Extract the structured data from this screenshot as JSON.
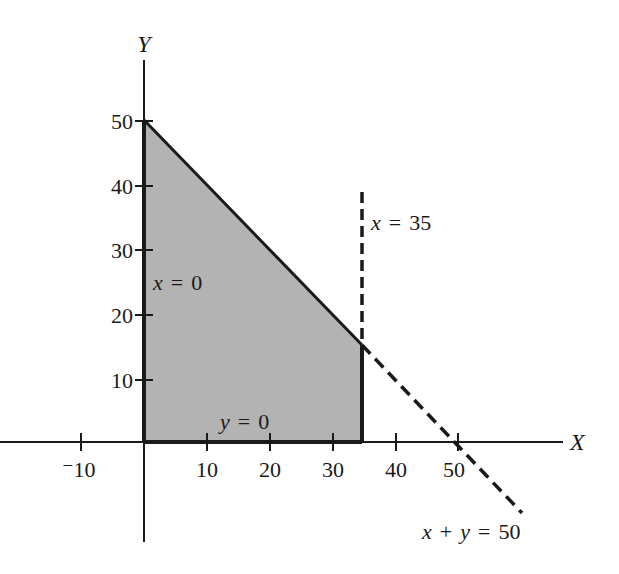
{
  "figure": {
    "axes": {
      "x_label": "X",
      "y_label": "Y",
      "x_ticks": [
        {
          "value": -10,
          "label": "⁻10"
        },
        {
          "value": 10,
          "label": "10"
        },
        {
          "value": 20,
          "label": "20"
        },
        {
          "value": 30,
          "label": "30"
        },
        {
          "value": 40,
          "label": "40"
        },
        {
          "value": 50,
          "label": "50"
        }
      ],
      "y_ticks": [
        {
          "value": 10,
          "label": "10"
        },
        {
          "value": 20,
          "label": "20"
        },
        {
          "value": 30,
          "label": "30"
        },
        {
          "value": 40,
          "label": "40"
        },
        {
          "value": 50,
          "label": "50"
        }
      ]
    },
    "constraints": [
      {
        "id": "x0",
        "var": "x",
        "op": "=",
        "rhs": "0",
        "style": "solid"
      },
      {
        "id": "y0",
        "var": "y",
        "op": "=",
        "rhs": "0",
        "style": "solid"
      },
      {
        "id": "x35",
        "var": "x",
        "op": "=",
        "rhs": "35",
        "style": "dashed"
      },
      {
        "id": "xy50",
        "var1": "x",
        "plus": "+",
        "var2": "y",
        "op": "=",
        "rhs": "50",
        "style": "dashed"
      }
    ],
    "feasible_region": {
      "vertices": [
        [
          0,
          0
        ],
        [
          0,
          50
        ],
        [
          35,
          15
        ],
        [
          35,
          0
        ]
      ],
      "fill": "#b3b3b3"
    },
    "colors": {
      "line": "#1a1a1a",
      "region": "#b3b3b3"
    }
  }
}
